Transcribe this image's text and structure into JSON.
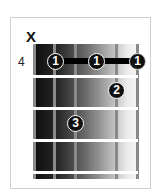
{
  "chord": {
    "muted_marker": "X",
    "start_fret": "4",
    "strings": 6,
    "frets_shown": 4,
    "fingers": [
      {
        "finger": "1",
        "string": 2,
        "fret": 1
      },
      {
        "finger": "1",
        "string": 4,
        "fret": 1
      },
      {
        "finger": "1",
        "string": 6,
        "fret": 1
      },
      {
        "finger": "2",
        "string": 5,
        "fret": 2
      },
      {
        "finger": "3",
        "string": 3,
        "fret": 3
      }
    ],
    "barre": {
      "from_string": 2,
      "to_string": 6,
      "fret": 1
    }
  }
}
